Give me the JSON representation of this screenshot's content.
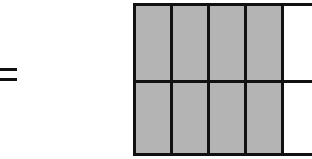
{
  "symbol": "=",
  "grid": {
    "rows": 2,
    "columns_visible": 5,
    "shaded_per_row": 4,
    "colors": {
      "shaded": "#b4b4b4",
      "empty": "#ffffff",
      "line": "#111111"
    },
    "cells": [
      [
        "shaded",
        "shaded",
        "shaded",
        "shaded",
        "empty"
      ],
      [
        "shaded",
        "shaded",
        "shaded",
        "shaded",
        "empty"
      ]
    ]
  }
}
